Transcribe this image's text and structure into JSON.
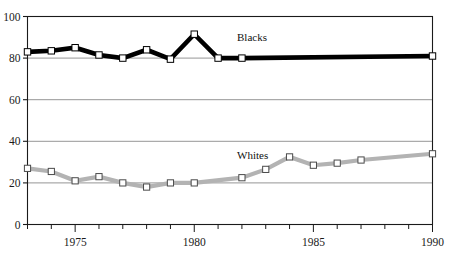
{
  "chart_data": {
    "type": "line",
    "title": "",
    "xlabel": "",
    "ylabel": "",
    "xlim": [
      1973,
      1990
    ],
    "ylim": [
      0,
      100
    ],
    "grid": true,
    "legend_position": "inline-annotation",
    "x": [
      1973,
      1974,
      1975,
      1976,
      1977,
      1978,
      1979,
      1980,
      1981,
      1982,
      1983,
      1984,
      1985,
      1986,
      1987,
      1988,
      1989,
      1990
    ],
    "xticks": [
      1973,
      1974,
      1975,
      1976,
      1977,
      1978,
      1979,
      1980,
      1981,
      1982,
      1983,
      1984,
      1985,
      1986,
      1987,
      1988,
      1989,
      1990
    ],
    "xtick_labels": [
      "",
      "",
      "1975",
      "",
      "",
      "",
      "",
      "1980",
      "",
      "",
      "",
      "",
      "1985",
      "",
      "",
      "",
      "",
      "1990"
    ],
    "yticks": [
      0,
      20,
      40,
      60,
      80,
      100
    ],
    "ytick_labels": [
      "0",
      "20",
      "40",
      "60",
      "80",
      "100"
    ],
    "series": [
      {
        "name": "Blacks",
        "color": "#000000",
        "marker": "white-square",
        "x": [
          1973,
          1974,
          1975,
          1976,
          1977,
          1978,
          1979,
          1980,
          1981,
          1982,
          1990
        ],
        "values": [
          83,
          83.5,
          85,
          81.5,
          80,
          84,
          79.5,
          91.5,
          80,
          80,
          81
        ],
        "label_text": "Blacks"
      },
      {
        "name": "Whites",
        "color": "#b3b3b3",
        "marker": "white-square",
        "x": [
          1973,
          1974,
          1975,
          1976,
          1977,
          1978,
          1979,
          1980,
          1982,
          1983,
          1984,
          1985,
          1986,
          1987,
          1990
        ],
        "values": [
          27,
          25.5,
          21,
          23,
          20,
          18,
          20,
          20,
          22.5,
          26.5,
          32.5,
          28.5,
          29.5,
          31,
          34
        ],
        "label_text": "Whites"
      }
    ]
  },
  "annotations": {
    "blacks_label": "Blacks",
    "whites_label": "Whites"
  }
}
